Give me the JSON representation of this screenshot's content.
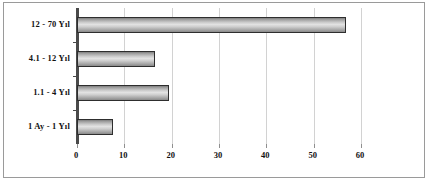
{
  "chart_data": {
    "type": "bar",
    "orientation": "horizontal",
    "title": "",
    "subtitle": "",
    "xlabel": "",
    "ylabel": "",
    "categories": [
      "1 Ay - 1 Yıl",
      "1.1 - 4 Yıl",
      "4.1 - 12 Yıl",
      "12 - 70 Yıl"
    ],
    "values": [
      7.6,
      19.5,
      16.5,
      56.8
    ],
    "xlim": [
      0,
      60
    ],
    "xticks": [
      0,
      10,
      20,
      30,
      40,
      50,
      60
    ],
    "xtick_labels": [
      "0",
      "10",
      "20",
      "30",
      "40",
      "50",
      "60"
    ],
    "grid": true,
    "grid_axis": "x",
    "legend": false,
    "series": [
      {
        "name": "",
        "values": [
          7.6,
          19.5,
          16.5,
          56.8
        ]
      }
    ],
    "colors": {
      "bar_fill_light": "#e2e2e2",
      "bar_fill_dark": "#7e7e7e",
      "bar_border": "#2e2e2e",
      "gridline": "#d2d2d2",
      "axis": "#4a4a4a",
      "plot_background": "#ffffff",
      "text": "#111111",
      "frame_border": "#9a9a9a"
    }
  }
}
